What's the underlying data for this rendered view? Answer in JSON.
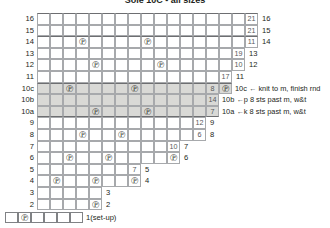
{
  "title": "Sole 10C - all sizes",
  "geometry": {
    "grid_left": 37,
    "grid_top": 13,
    "cell_w": 13,
    "cell_h": 11.6,
    "columns": 17
  },
  "symbols": {
    "purl": "℗",
    "legend": "℗"
  },
  "colors": {
    "grid_line": "#a7a9ac",
    "heavy_line": "#6d6e71",
    "shade": "#d9d9d6",
    "text": "#231f20",
    "number": "#58595b"
  },
  "chart_data": {
    "type": "table",
    "title": "Sole 10C - all sizes",
    "row_labels_left": [
      "16",
      "15",
      "14",
      "13",
      "12",
      "11",
      "10c",
      "10b",
      "10a",
      "9",
      "8",
      "7",
      "6",
      "5",
      "4",
      "3",
      "2"
    ],
    "row_labels_right": [
      "16",
      "15",
      "14",
      "13",
      "12",
      "11",
      "",
      "",
      "",
      "9",
      "8",
      "7",
      "6",
      "5",
      "4",
      "3",
      "2"
    ],
    "rows": [
      {
        "left": "16",
        "right": "16",
        "cells": 17,
        "shaded": false,
        "heavy_top": true,
        "stitches": [],
        "numbers": [
          {
            "col": 16,
            "value": "21"
          }
        ]
      },
      {
        "left": "15",
        "right": "15",
        "cells": 17,
        "shaded": false,
        "stitches": [],
        "numbers": [
          {
            "col": 16,
            "value": "21"
          }
        ]
      },
      {
        "left": "14",
        "right": "14",
        "cells": 17,
        "shaded": false,
        "heavy_top": true,
        "stitches": [
          3,
          8
        ],
        "numbers": [
          {
            "col": 16,
            "value": "11"
          }
        ]
      },
      {
        "left": "13",
        "right": "13",
        "cells": 16,
        "shaded": false,
        "stitches": [],
        "numbers": [
          {
            "col": 15,
            "value": "19"
          }
        ]
      },
      {
        "left": "12",
        "right": "12",
        "cells": 16,
        "shaded": false,
        "stitches": [
          4,
          9
        ],
        "numbers": [
          {
            "col": 15,
            "value": "10"
          }
        ]
      },
      {
        "left": "11",
        "right": "11",
        "cells": 15,
        "shaded": false,
        "stitches": [],
        "numbers": [
          {
            "col": 14,
            "value": "17"
          }
        ]
      },
      {
        "left": "10c",
        "right": "",
        "cells": 15,
        "shaded": true,
        "heavy_top": true,
        "stitches": [
          2,
          7,
          14
        ],
        "numbers": [
          {
            "col": 13,
            "value": "8"
          }
        ]
      },
      {
        "left": "10b",
        "right": "",
        "cells": 14,
        "shaded": true,
        "stitches": [],
        "numbers": [
          {
            "col": 13,
            "value": "14"
          }
        ]
      },
      {
        "left": "10a",
        "right": "",
        "cells": 14,
        "shaded": true,
        "heavy_bottom": true,
        "stitches": [
          4,
          8
        ],
        "numbers": [
          {
            "col": 13,
            "value": "7"
          }
        ]
      },
      {
        "left": "9",
        "right": "9",
        "cells": 13,
        "shaded": false,
        "stitches": [],
        "numbers": [
          {
            "col": 12,
            "value": "12"
          }
        ]
      },
      {
        "left": "8",
        "right": "8",
        "cells": 13,
        "shaded": false,
        "stitches": [
          3,
          6
        ],
        "numbers": [
          {
            "col": 12,
            "value": "6"
          }
        ]
      },
      {
        "left": "7",
        "right": "7",
        "cells": 11,
        "shaded": false,
        "stitches": [],
        "numbers": [
          {
            "col": 10,
            "value": "10"
          }
        ]
      },
      {
        "left": "6",
        "right": "6",
        "cells": 11,
        "shaded": false,
        "stitches": [
          2,
          5,
          10
        ],
        "numbers": []
      },
      {
        "left": "5",
        "right": "5",
        "cells": 8,
        "shaded": false,
        "stitches": [],
        "numbers": [
          {
            "col": 7,
            "value": "7"
          }
        ]
      },
      {
        "left": "4",
        "right": "4",
        "cells": 8,
        "shaded": false,
        "stitches": [
          1,
          4,
          7
        ],
        "numbers": []
      },
      {
        "left": "3",
        "right": "3",
        "cells": 5,
        "shaded": false,
        "stitches": [],
        "numbers": []
      },
      {
        "left": "2",
        "right": "2",
        "cells": 5,
        "shaded": false,
        "stitches": [
          4
        ],
        "numbers": []
      }
    ],
    "notes": [
      {
        "row": "10c",
        "text": "10c ← knit to m, finish rnd"
      },
      {
        "row": "10b",
        "text": "10b ←p 8 sts past m, w&t"
      },
      {
        "row": "10a",
        "text": "10a ←k 8 sts past m, w&t"
      }
    ],
    "setup_row": {
      "label": "1(set-up)",
      "cells": 6,
      "legend_symbol_col": 1
    }
  }
}
